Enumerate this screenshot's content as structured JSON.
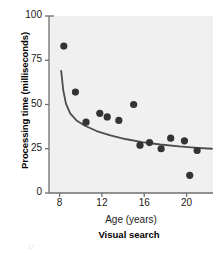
{
  "chart_data": {
    "type": "scatter",
    "title": "",
    "caption": "Visual search",
    "xlabel": "Age (years)",
    "ylabel": "Processing time (milliseconds)",
    "xlim": [
      7.0,
      22.5
    ],
    "ylim": [
      0,
      100
    ],
    "xticks": [
      8,
      12,
      16,
      20
    ],
    "yticks": [
      0,
      25,
      50,
      75,
      100
    ],
    "xtick_labels": [
      "8",
      "12",
      "16",
      "20"
    ],
    "ytick_labels": [
      "0",
      "25",
      "50",
      "75",
      "100"
    ],
    "grid": false,
    "legend": null,
    "marker_color": "#333333",
    "fit_line_color": "#4d4d4d",
    "panel_background": "#f0f0f0",
    "points": [
      {
        "x": 8.4,
        "y": 83.0
      },
      {
        "x": 9.5,
        "y": 57.0
      },
      {
        "x": 10.5,
        "y": 40.0
      },
      {
        "x": 11.8,
        "y": 45.0
      },
      {
        "x": 12.5,
        "y": 43.0
      },
      {
        "x": 13.6,
        "y": 41.0
      },
      {
        "x": 15.0,
        "y": 50.0
      },
      {
        "x": 15.6,
        "y": 27.0
      },
      {
        "x": 16.5,
        "y": 28.5
      },
      {
        "x": 17.6,
        "y": 25.0
      },
      {
        "x": 18.5,
        "y": 31.0
      },
      {
        "x": 19.8,
        "y": 29.5
      },
      {
        "x": 20.3,
        "y": 10.0
      },
      {
        "x": 21.0,
        "y": 24.0
      }
    ],
    "fit_curve": [
      {
        "x": 8.15,
        "y": 69.0
      },
      {
        "x": 8.35,
        "y": 58.0
      },
      {
        "x": 8.6,
        "y": 50.5
      },
      {
        "x": 9.0,
        "y": 45.0
      },
      {
        "x": 9.6,
        "y": 41.0
      },
      {
        "x": 10.4,
        "y": 38.0
      },
      {
        "x": 11.5,
        "y": 35.0
      },
      {
        "x": 12.8,
        "y": 32.5
      },
      {
        "x": 14.2,
        "y": 30.5
      },
      {
        "x": 15.8,
        "y": 28.8
      },
      {
        "x": 17.5,
        "y": 27.4
      },
      {
        "x": 19.3,
        "y": 26.3
      },
      {
        "x": 21.0,
        "y": 25.5
      },
      {
        "x": 22.4,
        "y": 25.0
      }
    ]
  },
  "corner_mark": "17"
}
